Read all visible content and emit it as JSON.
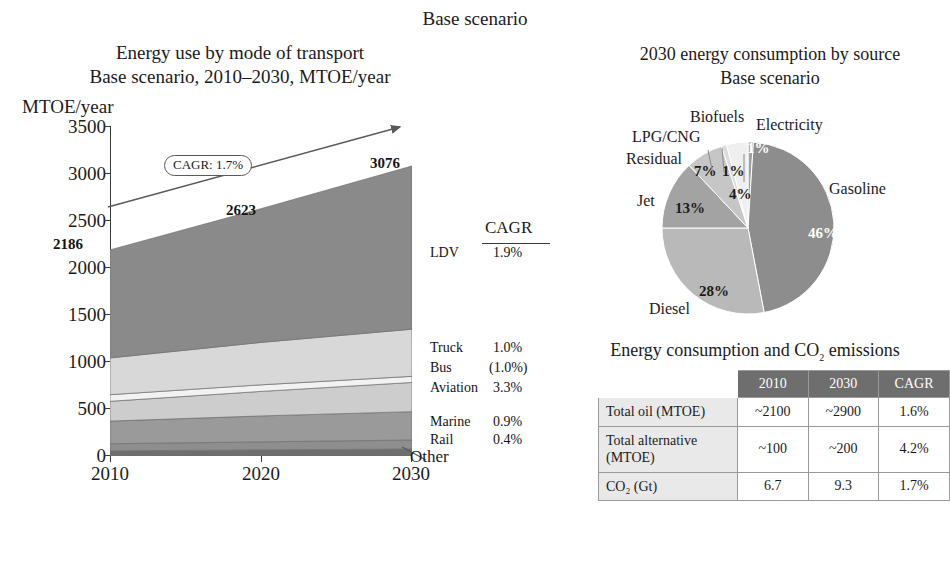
{
  "header": {
    "title": "Base scenario"
  },
  "area_chart": {
    "title_line1": "Energy use by mode of transport",
    "title_line2": "Base scenario, 2010–2030, MTOE/year",
    "y_axis_caption": "MTOE/year",
    "y_ticks": [
      "3500",
      "3000",
      "2500",
      "2000",
      "1500",
      "1000",
      "500",
      "0"
    ],
    "x_ticks": [
      "2010",
      "2020",
      "2030"
    ],
    "callout": "CAGR: 1.7%",
    "value_labels": [
      "2186",
      "2623",
      "3076"
    ],
    "cagr_header": "CAGR",
    "other_label": "Other",
    "legend": [
      {
        "label": "LDV",
        "cagr": "1.9%"
      },
      {
        "label": "Truck",
        "cagr": "1.0%"
      },
      {
        "label": "Bus",
        "cagr": "(1.0%)"
      },
      {
        "label": "Aviation",
        "cagr": "3.3%"
      },
      {
        "label": "Marine",
        "cagr": "0.9%"
      },
      {
        "label": "Rail",
        "cagr": "0.4%"
      }
    ]
  },
  "pie_chart": {
    "title_line1": "2030 energy consumption by source",
    "title_line2": "Base scenario",
    "labels": [
      "Gasoline",
      "Diesel",
      "Jet",
      "Residual",
      "LPG/CNG",
      "Biofuels",
      "Electricity"
    ],
    "percents": [
      "46%",
      "28%",
      "13%",
      "7%",
      "1%",
      "4%",
      "1%"
    ]
  },
  "table": {
    "title_pre": "Energy consumption and CO",
    "title_sub": "2",
    "title_post": " emissions",
    "columns": [
      "",
      "2010",
      "2030",
      "CAGR"
    ],
    "rows": [
      {
        "label": "Total oil (MTOE)",
        "y2010": "~2100",
        "y2030": "~2900",
        "cagr": "1.6%"
      },
      {
        "label": "Total alternative (MTOE)",
        "y2010": "~100",
        "y2030": "~200",
        "cagr": "4.2%"
      },
      {
        "label": "CO₂ (Gt)",
        "y2010": "6.7",
        "y2030": "9.3",
        "cagr": "1.7%"
      }
    ]
  },
  "chart_data": [
    {
      "type": "area",
      "title": "Energy use by mode of transport — Base scenario, 2010–2030, MTOE/year",
      "xlabel": "",
      "ylabel": "MTOE/year",
      "x": [
        2010,
        2020,
        2030
      ],
      "xlim": [
        2010,
        2030
      ],
      "ylim": [
        0,
        3500
      ],
      "yticks": [
        0,
        500,
        1000,
        1500,
        2000,
        2500,
        3000,
        3500
      ],
      "grid": false,
      "stacked": true,
      "totals": [
        2186,
        2623,
        3076
      ],
      "total_cagr": "1.7%",
      "series": [
        {
          "name": "Other",
          "values": [
            55,
            65,
            75
          ],
          "cagr": "",
          "color": "#6e6e6e"
        },
        {
          "name": "Rail",
          "values": [
            75,
            85,
            95
          ],
          "cagr": "0.4%",
          "color": "#8e8e8e"
        },
        {
          "name": "Marine",
          "values": [
            240,
            275,
            300
          ],
          "cagr": "0.9%",
          "color": "#9a9a9a"
        },
        {
          "name": "Aviation",
          "values": [
            210,
            260,
            310
          ],
          "cagr": "3.3%",
          "color": "#cdcdcd"
        },
        {
          "name": "Bus",
          "values": [
            70,
            70,
            65
          ],
          "cagr": "(1.0%)",
          "color": "#f2f2f2"
        },
        {
          "name": "Truck",
          "values": [
            390,
            450,
            500
          ],
          "cagr": "1.0%",
          "color": "#d8d8d8"
        },
        {
          "name": "LDV",
          "values": [
            1146,
            1418,
            1731
          ],
          "cagr": "1.9%",
          "color": "#8a8a8a"
        }
      ],
      "trendline": {
        "label": "CAGR: 1.7%",
        "start": [
          2010,
          2800
        ],
        "end": [
          2030,
          3450
        ]
      }
    },
    {
      "type": "pie",
      "title": "2030 energy consumption by source — Base scenario",
      "labels": [
        "Gasoline",
        "Diesel",
        "Jet",
        "Residual",
        "LPG/CNG",
        "Biofuels",
        "Electricity"
      ],
      "values": [
        46,
        28,
        13,
        7,
        1,
        4,
        1
      ],
      "colors": [
        "#8d8d8d",
        "#b9b9b9",
        "#a3a3a3",
        "#c6c6c6",
        "#dcdcdc",
        "#efefef",
        "#9f9f9f"
      ],
      "legend": "outside-labels"
    },
    {
      "type": "table",
      "title": "Energy consumption and CO2 emissions",
      "columns": [
        "",
        "2010",
        "2030",
        "CAGR"
      ],
      "rows": [
        [
          "Total oil (MTOE)",
          "~2100",
          "~2900",
          "1.6%"
        ],
        [
          "Total alternative (MTOE)",
          "~100",
          "~200",
          "4.2%"
        ],
        [
          "CO2 (Gt)",
          "6.7",
          "9.3",
          "1.7%"
        ]
      ]
    }
  ]
}
